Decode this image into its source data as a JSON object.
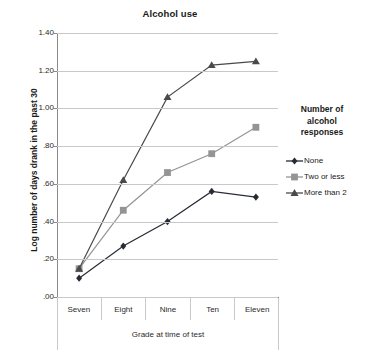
{
  "chart_data": {
    "type": "line",
    "title": "Alcohol use",
    "xlabel": "Grade at time of test",
    "ylabel": "Log number of days drank in the past 30",
    "categories": [
      "Seven",
      "Eight",
      "Nine",
      "Ten",
      "Eleven"
    ],
    "ylim": [
      0.0,
      1.4
    ],
    "yticks": [
      "1.40",
      "1.20",
      "1.00",
      ".80",
      ".60",
      ".40",
      ".20",
      ".00"
    ],
    "ytick_values": [
      1.4,
      1.2,
      1.0,
      0.8,
      0.6,
      0.4,
      0.2,
      0.0
    ],
    "grid": true,
    "legend_position": "right",
    "legend_title": "Number of alcohol responses",
    "series": [
      {
        "name": "None",
        "marker": "diamond",
        "color": "#262b35",
        "values": [
          0.1,
          0.27,
          0.4,
          0.56,
          0.53
        ]
      },
      {
        "name": "Two or less",
        "marker": "square",
        "color": "#949494",
        "values": [
          0.15,
          0.46,
          0.66,
          0.76,
          0.9
        ]
      },
      {
        "name": "More than 2",
        "marker": "triangle",
        "color": "#4a4a4a",
        "values": [
          0.15,
          0.62,
          1.06,
          1.23,
          1.25
        ]
      }
    ]
  },
  "legend": {
    "title_lines": [
      "Number of",
      "alcohol",
      "responses"
    ]
  },
  "colors": {
    "gridline": "#c8c8c8",
    "axis": "#8a8a8a",
    "text": "#1a1a1a",
    "series_none": "#262b35",
    "series_two_or_less": "#949494",
    "series_more_than_2": "#4a4a4a"
  }
}
